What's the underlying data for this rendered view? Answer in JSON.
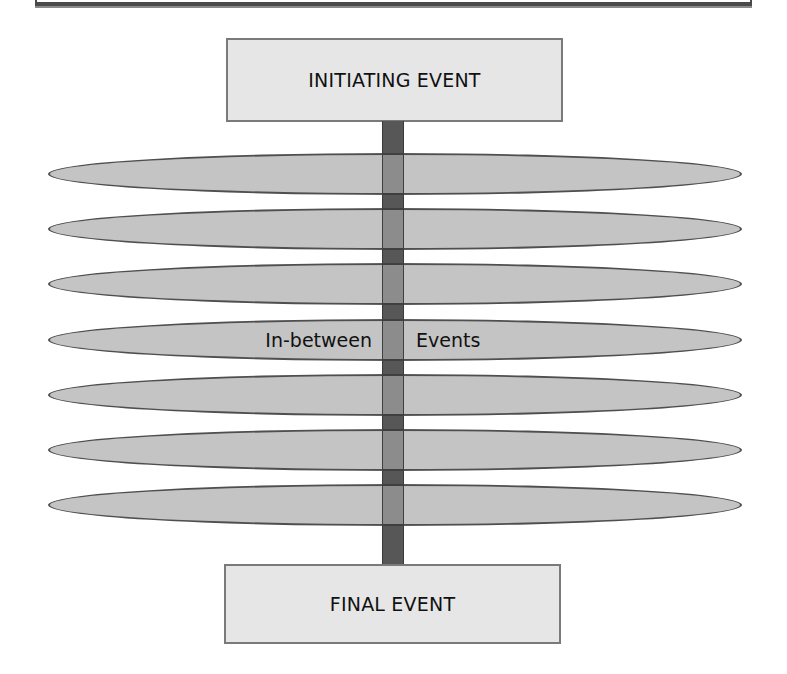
{
  "diagram": {
    "initiating_event": {
      "label": "INITIATING EVENT"
    },
    "final_event": {
      "label": "FINAL EVENT"
    },
    "in_between": {
      "left_label": "In-between",
      "right_label": "Events",
      "label_row_index": 3,
      "row_count": 7
    },
    "rows": [
      {
        "top": 153
      },
      {
        "top": 208
      },
      {
        "top": 263
      },
      {
        "top": 319
      },
      {
        "top": 374
      },
      {
        "top": 429
      },
      {
        "top": 484
      }
    ],
    "colors": {
      "box_fill": "#e6e6e6",
      "box_border": "#7a7a7a",
      "pill_fill": "#c4c4c4",
      "pill_border": "#4f4f4f",
      "spine_dark": "#575757",
      "spine_light": "#8c8c8c"
    }
  }
}
